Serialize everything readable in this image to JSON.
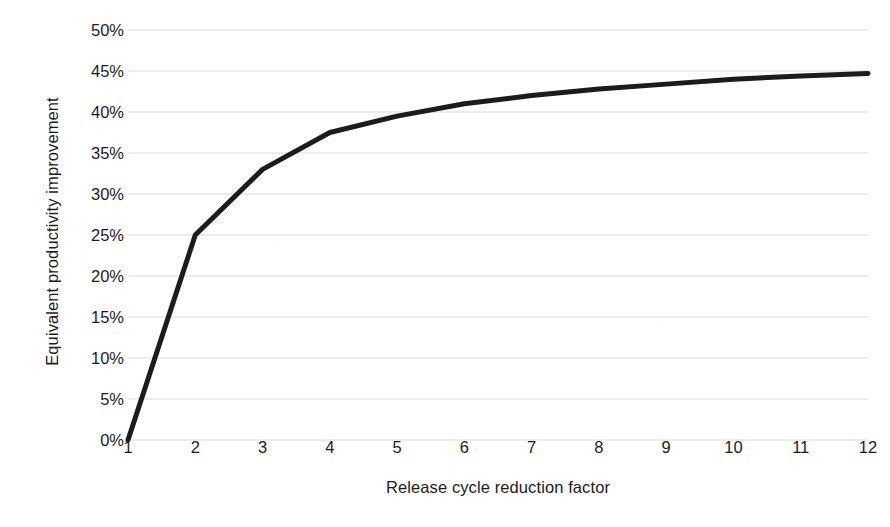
{
  "chart_data": {
    "type": "line",
    "title": "",
    "xlabel": "Release cycle reduction factor",
    "ylabel": "Equivalent productivity improvement",
    "x": [
      1,
      2,
      3,
      4,
      5,
      6,
      7,
      8,
      9,
      10,
      11,
      12
    ],
    "categories": [
      "1",
      "2",
      "3",
      "4",
      "5",
      "6",
      "7",
      "8",
      "9",
      "10",
      "11",
      "12"
    ],
    "values": [
      0,
      25,
      33,
      37.5,
      39.5,
      41,
      42,
      42.8,
      43.4,
      44,
      44.4,
      44.7
    ],
    "series": [
      {
        "name": "Equivalent productivity improvement",
        "values": [
          0,
          25,
          33,
          37.5,
          39.5,
          41,
          42,
          42.8,
          43.4,
          44,
          44.4,
          44.7
        ],
        "color": "#1c1c1c"
      }
    ],
    "xlim": [
      1,
      12
    ],
    "ylim": [
      0,
      50
    ],
    "x_tick_labels": [
      "1",
      "2",
      "3",
      "4",
      "5",
      "6",
      "7",
      "8",
      "9",
      "10",
      "11",
      "12"
    ],
    "y_tick_labels": [
      "0%",
      "5%",
      "10%",
      "15%",
      "20%",
      "25%",
      "30%",
      "35%",
      "40%",
      "45%",
      "50%"
    ],
    "y_tick_values": [
      0,
      5,
      10,
      15,
      20,
      25,
      30,
      35,
      40,
      45,
      50
    ],
    "grid": "horizontal",
    "grid_color": "#d9d9d9",
    "legend": "none",
    "background": "#ffffff"
  }
}
